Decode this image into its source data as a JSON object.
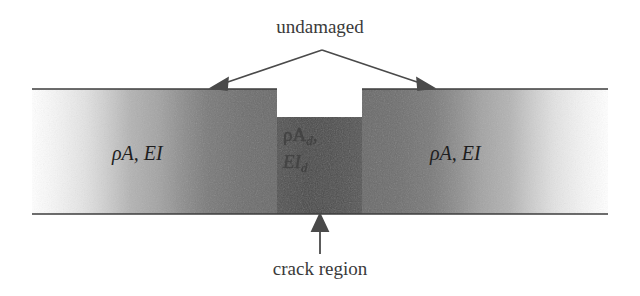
{
  "figure": {
    "title_annotation": "undamaged",
    "bottom_annotation": "crack region",
    "left_section_label": "ρA, EI",
    "right_section_label": "ρA, EI",
    "center_section": {
      "line1_rho": "ρA",
      "line1_sub": "d",
      "line1_comma": ",",
      "line2_ei": "EI",
      "line2_sub": "d"
    },
    "colors": {
      "background": "#ffffff",
      "outline": "#3d3d3d",
      "arrow": "#4a4a4a",
      "beam_light": "#f7f7f7",
      "beam_mid": "#bdbdbd",
      "beam_dark": "#6e6e6e",
      "beam_darkest": "#4e4e4e",
      "text": "#2b2b2b"
    },
    "geometry": {
      "beam_top_y": 89,
      "beam_bottom_y": 214,
      "beam_left_x": 32,
      "beam_right_x": 608,
      "notch_left_x": 277,
      "notch_right_x": 362,
      "notch_bottom_y": 117,
      "arrow_apex_x": 322,
      "arrow_apex_y": 50,
      "arrow_left_tip_x": 217,
      "arrow_right_tip_x": 428,
      "crack_arrow_x": 320
    }
  }
}
